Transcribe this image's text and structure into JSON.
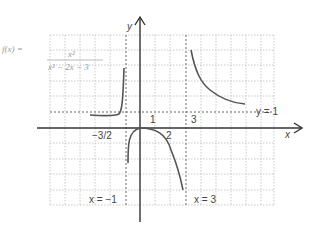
{
  "function": {
    "name_label": "f(x) =",
    "numerator": "x²",
    "denominator": "x² − 2x − 3"
  },
  "axes": {
    "x_label": "x",
    "y_label": "y"
  },
  "asymptotes": {
    "horizontal": "y = 1",
    "vertical_left": "x = −1",
    "vertical_right": "x = 3"
  },
  "tick_labels": {
    "one": "1",
    "two": "2",
    "three": "3",
    "neg_three_halves": "−3/2"
  },
  "colors": {
    "curve": "#555555",
    "axis": "#333333",
    "grid": "#bbbbbb",
    "asymptote": "#666666"
  }
}
